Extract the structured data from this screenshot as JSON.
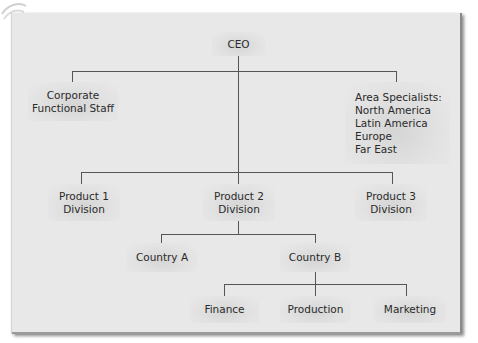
{
  "diagram": {
    "type": "org-chart",
    "colors": {
      "panel_background": "#e8e8e8",
      "box_fill": "#dcdcdc",
      "connector": "#555555",
      "text": "#2a2a2a"
    },
    "nodes": {
      "ceo": {
        "label": "CEO"
      },
      "corporate_staff": {
        "label": "Corporate\nFunctional Staff"
      },
      "area_specialists": {
        "label": "Area Specialists:\nNorth America\nLatin America\nEurope\nFar East"
      },
      "product_1": {
        "label": "Product 1\nDivision"
      },
      "product_2": {
        "label": "Product 2\nDivision"
      },
      "product_3": {
        "label": "Product 3\nDivision"
      },
      "country_a": {
        "label": "Country A"
      },
      "country_b": {
        "label": "Country B"
      },
      "finance": {
        "label": "Finance"
      },
      "production": {
        "label": "Production"
      },
      "marketing": {
        "label": "Marketing"
      }
    },
    "edges": [
      [
        "ceo",
        "corporate_staff"
      ],
      [
        "ceo",
        "area_specialists"
      ],
      [
        "ceo",
        "product_1"
      ],
      [
        "ceo",
        "product_2"
      ],
      [
        "ceo",
        "product_3"
      ],
      [
        "product_2",
        "country_a"
      ],
      [
        "product_2",
        "country_b"
      ],
      [
        "country_b",
        "finance"
      ],
      [
        "country_b",
        "production"
      ],
      [
        "country_b",
        "marketing"
      ]
    ]
  }
}
